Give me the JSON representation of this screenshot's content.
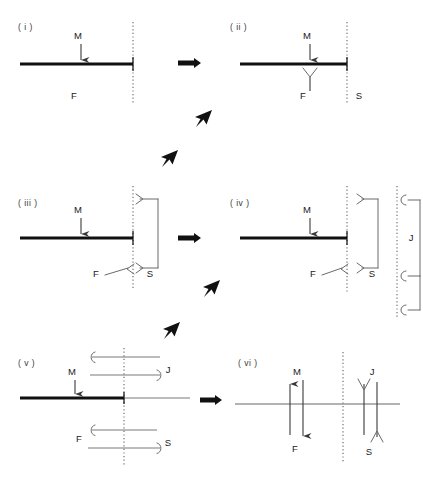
{
  "figure": {
    "background_color": "#ffffff",
    "ink_color": "#1a1a1a",
    "width": 423,
    "height": 479
  },
  "panels": [
    {
      "id": "i",
      "label": "( i )",
      "label_x": 18,
      "label_y": 30,
      "symbols": [
        {
          "name": "M",
          "text": "M",
          "x": 78,
          "y": 39
        },
        {
          "name": "F",
          "text": "F",
          "x": 74,
          "y": 99
        }
      ],
      "dotted_lines": [
        {
          "x": 133,
          "y1": 22,
          "y2": 104
        }
      ],
      "bar": {
        "x1": 20,
        "x2": 133,
        "y": 64
      }
    },
    {
      "id": "ii",
      "label": "( ii )",
      "label_x": 230,
      "label_y": 30,
      "symbols": [
        {
          "name": "M",
          "text": "M",
          "x": 307,
          "y": 39
        },
        {
          "name": "F",
          "text": "F",
          "x": 303,
          "y": 99
        },
        {
          "name": "S",
          "text": "S",
          "x": 359,
          "y": 99
        }
      ],
      "dotted_lines": [
        {
          "x": 347,
          "y1": 22,
          "y2": 104
        }
      ],
      "bar": {
        "x1": 240,
        "x2": 347,
        "y": 64
      }
    },
    {
      "id": "iii",
      "label": "( iii )",
      "label_x": 18,
      "label_y": 206,
      "symbols": [
        {
          "name": "M",
          "text": "M",
          "x": 78,
          "y": 213
        },
        {
          "name": "F",
          "text": "F",
          "x": 96,
          "y": 277
        },
        {
          "name": "S",
          "text": "S",
          "x": 148,
          "y": 277
        }
      ],
      "dotted_lines": [
        {
          "x": 133,
          "y1": 186,
          "y2": 290
        }
      ],
      "bar": {
        "x1": 20,
        "x2": 133,
        "y": 238
      },
      "brackets": [
        {
          "name": "S-bracket",
          "x": 158,
          "y_top": 199,
          "y_bottom": 268,
          "arm": 18
        }
      ]
    },
    {
      "id": "iv",
      "label": "( iv )",
      "label_x": 230,
      "label_y": 206,
      "symbols": [
        {
          "name": "M",
          "text": "M",
          "x": 307,
          "y": 213
        },
        {
          "name": "F",
          "text": "F",
          "x": 313,
          "y": 277
        },
        {
          "name": "S",
          "text": "S",
          "x": 371,
          "y": 277
        },
        {
          "name": "J",
          "text": "J",
          "x": 410,
          "y": 240
        }
      ],
      "dotted_lines": [
        {
          "x": 347,
          "y1": 186,
          "y2": 292
        },
        {
          "x": 397,
          "y1": 186,
          "y2": 318
        }
      ],
      "bar": {
        "x1": 240,
        "x2": 347,
        "y": 238
      },
      "brackets": [
        {
          "name": "S-bracket",
          "x": 378,
          "y_top": 199,
          "y_bottom": 268,
          "arm": 16
        },
        {
          "name": "J-bracket-upper",
          "x": 420,
          "y_top": 200,
          "y_bottom": 276,
          "arm": 15
        },
        {
          "name": "J-bracket-lower",
          "x": 420,
          "y_top": 276,
          "y_bottom": 310,
          "arm": 15
        }
      ]
    },
    {
      "id": "v",
      "label": "( v )",
      "label_x": 18,
      "label_y": 366,
      "symbols": [
        {
          "name": "M",
          "text": "M",
          "x": 72,
          "y": 375
        },
        {
          "name": "F",
          "text": "F",
          "x": 77,
          "y": 441
        },
        {
          "name": "S",
          "text": "S",
          "x": 167,
          "y": 445
        },
        {
          "name": "J",
          "text": "J",
          "x": 167,
          "y": 373
        }
      ],
      "dotted_lines": [
        {
          "x": 124,
          "y1": 348,
          "y2": 465
        }
      ],
      "bar": {
        "x1": 20,
        "x2": 124,
        "y": 398
      },
      "thin_extension": {
        "x1": 124,
        "x2": 190,
        "y": 398
      },
      "flow_arrows": [
        {
          "name": "J-in",
          "direction": "left",
          "x1": 90,
          "x2": 160,
          "y": 357
        },
        {
          "name": "J-out",
          "direction": "right",
          "x1": 90,
          "x2": 163,
          "y": 375
        },
        {
          "name": "F-in",
          "direction": "left",
          "x1": 90,
          "x2": 157,
          "y": 430
        },
        {
          "name": "S-out",
          "direction": "right",
          "x1": 88,
          "x2": 163,
          "y": 448
        }
      ]
    },
    {
      "id": "vi",
      "label": "( vi )",
      "label_x": 238,
      "label_y": 366,
      "symbols": [
        {
          "name": "M",
          "text": "M",
          "x": 297,
          "y": 375
        },
        {
          "name": "F",
          "text": "F",
          "x": 294,
          "y": 449
        },
        {
          "name": "J",
          "text": "J",
          "x": 372,
          "y": 375
        },
        {
          "name": "S",
          "text": "S",
          "x": 368,
          "y": 452
        }
      ],
      "dotted_lines": [
        {
          "x": 343,
          "y1": 352,
          "y2": 462
        }
      ],
      "axis": {
        "x1": 235,
        "x2": 400,
        "y": 404
      },
      "vertical_arrows": [
        {
          "name": "M-arrow",
          "x": 290,
          "y_top": 382,
          "y_bottom": 435,
          "points": "up"
        },
        {
          "name": "F-arrow",
          "x": 302,
          "y_top": 380,
          "y_bottom": 440,
          "points": "down"
        },
        {
          "name": "J-arrow",
          "x": 365,
          "y_top": 382,
          "y_bottom": 435,
          "points": "down"
        },
        {
          "name": "S-arrow",
          "x": 376,
          "y_top": 380,
          "y_bottom": 440,
          "points": "up"
        }
      ]
    }
  ],
  "transitions": [
    {
      "name": "arrow-i-to-ii",
      "type": "right",
      "x": 188,
      "y": 63
    },
    {
      "name": "arrow-ii-to-iii-a",
      "type": "diagonal-down-left",
      "x": 205,
      "y": 118
    },
    {
      "name": "arrow-ii-to-iii-b",
      "type": "diagonal-down-left",
      "x": 170,
      "y": 158
    },
    {
      "name": "arrow-iii-to-iv",
      "type": "right",
      "x": 188,
      "y": 238
    },
    {
      "name": "arrow-iv-to-v-a",
      "type": "diagonal-down-left",
      "x": 213,
      "y": 288
    },
    {
      "name": "arrow-iv-to-v-b",
      "type": "diagonal-down-left",
      "x": 172,
      "y": 330
    },
    {
      "name": "arrow-v-to-vi",
      "type": "right",
      "x": 209,
      "y": 400
    }
  ]
}
